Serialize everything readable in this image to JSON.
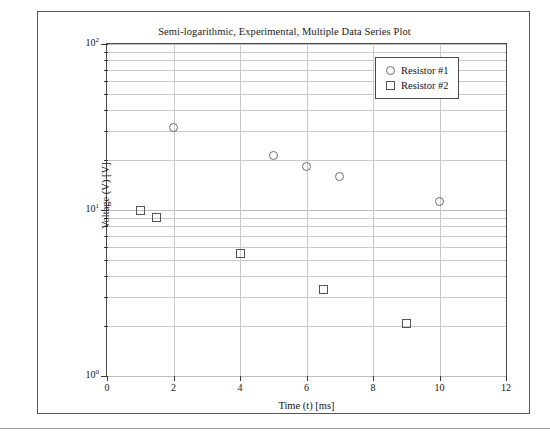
{
  "chart_data": {
    "type": "scatter",
    "title": "Semi-logarithmic, Experimental, Multiple Data Series Plot",
    "xlabel": "Time (t) [ms]",
    "ylabel": "Voltage (V) [V]",
    "xscale": "linear",
    "yscale": "log",
    "xlim": [
      0,
      12
    ],
    "ylim": [
      1,
      100
    ],
    "xticks": [
      0,
      2,
      4,
      6,
      8,
      10,
      12
    ],
    "xtick_labels": [
      "0",
      "2",
      "4",
      "6",
      "8",
      "10",
      "12"
    ],
    "yticks": [
      1,
      10,
      100
    ],
    "ytick_labels": [
      "10",
      "10",
      "10"
    ],
    "ytick_exponents": [
      "0",
      "1",
      "2"
    ],
    "grid": "horizontal-log-minor-and-vertical-major",
    "legend_position": "top-right-inside",
    "series": [
      {
        "name": "Resistor #1",
        "marker": "circle",
        "color": "#6e6e6e",
        "points": [
          {
            "x": 2.0,
            "y": 31.6
          },
          {
            "x": 5.0,
            "y": 21.4
          },
          {
            "x": 6.0,
            "y": 18.4
          },
          {
            "x": 7.0,
            "y": 16.0
          },
          {
            "x": 10.0,
            "y": 11.3
          }
        ]
      },
      {
        "name": "Resistor #2",
        "marker": "square",
        "color": "#555555",
        "points": [
          {
            "x": 1.0,
            "y": 10.0
          },
          {
            "x": 1.5,
            "y": 9.0
          },
          {
            "x": 4.0,
            "y": 5.5
          },
          {
            "x": 6.5,
            "y": 3.3
          },
          {
            "x": 9.0,
            "y": 2.08
          }
        ]
      }
    ]
  }
}
